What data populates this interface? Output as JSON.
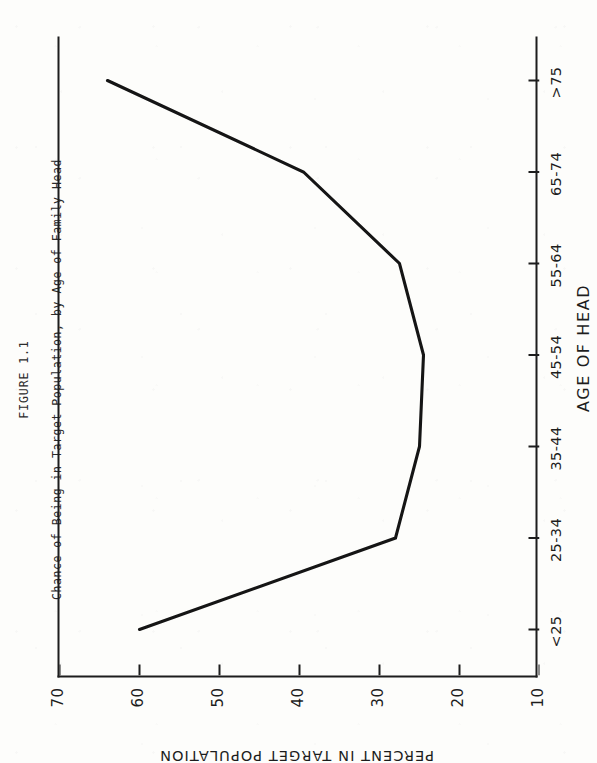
{
  "caption": {
    "figure_number": "FIGURE 1.1",
    "title": "Chance of Being in Target Population, by Age of Family Head"
  },
  "chart_data": {
    "type": "line",
    "title": "Chance of Being in Target Population, by Age of Family Head",
    "xlabel": "AGE OF HEAD",
    "ylabel": "PERCENT IN TARGET POPULATION",
    "categories": [
      "<25",
      "25-34",
      "35-44",
      "45-54",
      "55-64",
      "65-74",
      ">75"
    ],
    "values": [
      60,
      28,
      25,
      24.5,
      27.5,
      39.5,
      64
    ],
    "ylim": [
      10,
      70
    ],
    "yticks": [
      10,
      20,
      30,
      40,
      50,
      60,
      70
    ],
    "ytick_labels": [
      "10",
      "20",
      "30",
      "40",
      "50",
      "60",
      "70"
    ],
    "xtick_labels": [
      "<25",
      "25-34",
      "35-44",
      "45-54",
      "55-64",
      "65-74",
      ">75"
    ],
    "grid": false,
    "legend": false,
    "series": [
      {
        "name": "Percent in target population",
        "values": [
          60,
          28,
          25,
          24.5,
          27.5,
          39.5,
          64
        ]
      }
    ],
    "line_color": "#151515",
    "orientation": "page-rotated-90-ccw"
  }
}
